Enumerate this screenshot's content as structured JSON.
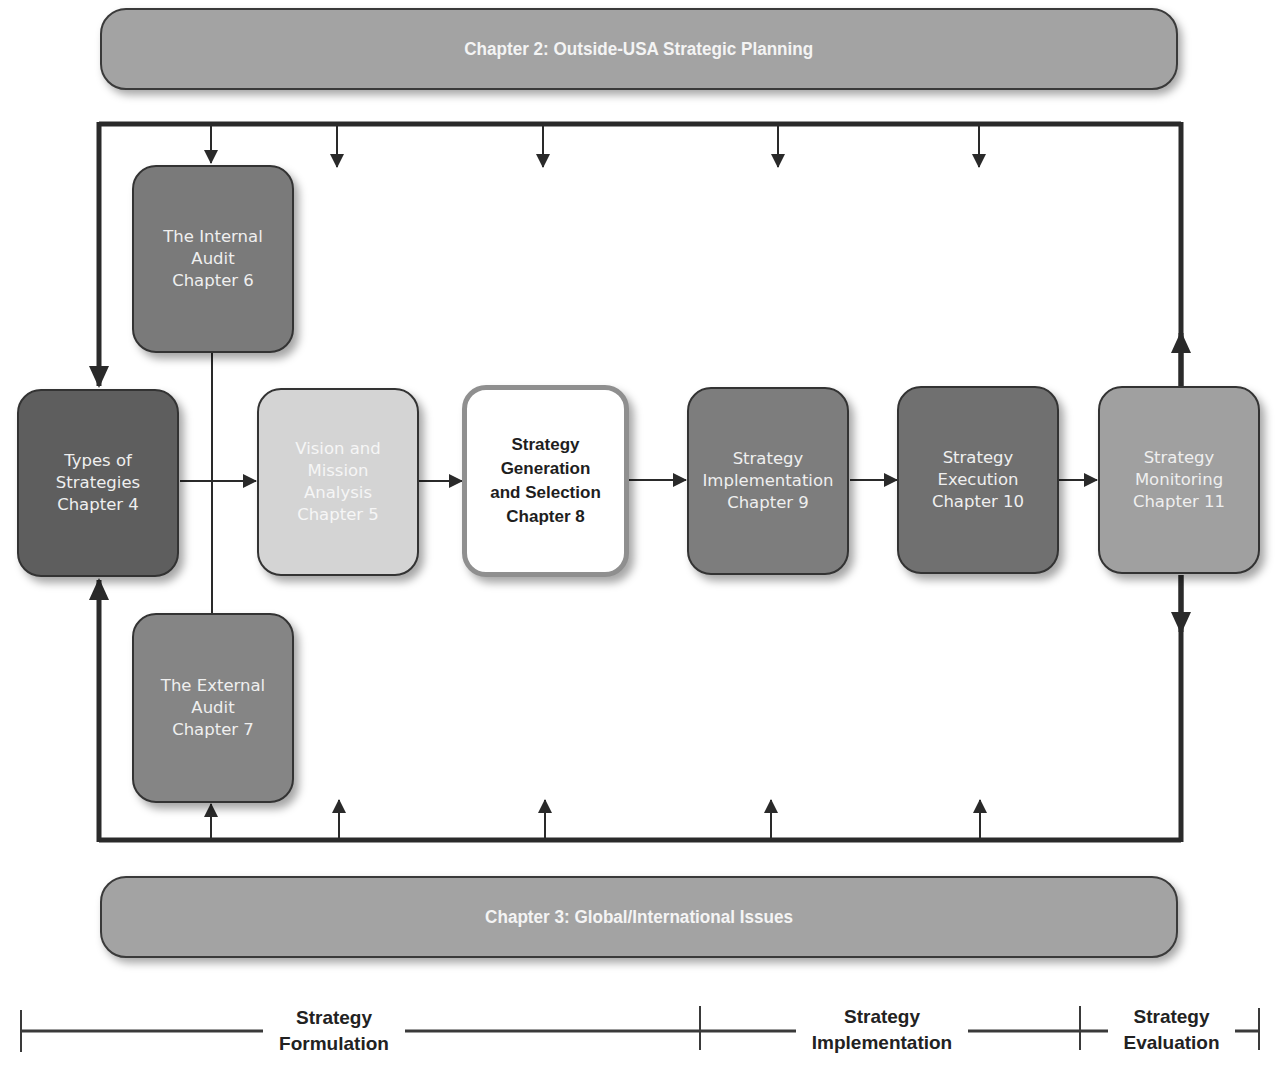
{
  "banners": {
    "top": "Chapter 2: Outside-USA Strategic Planning",
    "bottom": "Chapter 3: Global/International Issues"
  },
  "boxes": {
    "types_of_strategies": {
      "label": "Types of\nStrategies\nChapter 4",
      "fill": "#5e5e5e"
    },
    "internal_audit": {
      "label": "The Internal\nAudit\nChapter 6",
      "fill": "#7a7a7a"
    },
    "external_audit": {
      "label": "The External\nAudit\nChapter 7",
      "fill": "#858585"
    },
    "vision_mission": {
      "label": "Vision and\nMission\nAnalysis\nChapter 5",
      "fill": "#d4d4d4"
    },
    "generation_selection": {
      "label": "Strategy\nGeneration\nand Selection\nChapter 8",
      "fill": "#ffffff"
    },
    "implementation": {
      "label": "Strategy\nImplementation\nChapter 9",
      "fill": "#7d7d7d"
    },
    "execution": {
      "label": "Strategy\nExecution\nChapter 10",
      "fill": "#707070"
    },
    "monitoring": {
      "label": "Strategy\nMonitoring\nChapter 11",
      "fill": "#a0a0a0"
    }
  },
  "phases": [
    {
      "label": "Strategy\nFormulation"
    },
    {
      "label": "Strategy\nImplementation"
    },
    {
      "label": "Strategy\nEvaluation"
    }
  ],
  "colors": {
    "line": "#2a2a2a",
    "banner_fill": "#a3a3a3",
    "highlight_border": "#8f8f8f"
  }
}
